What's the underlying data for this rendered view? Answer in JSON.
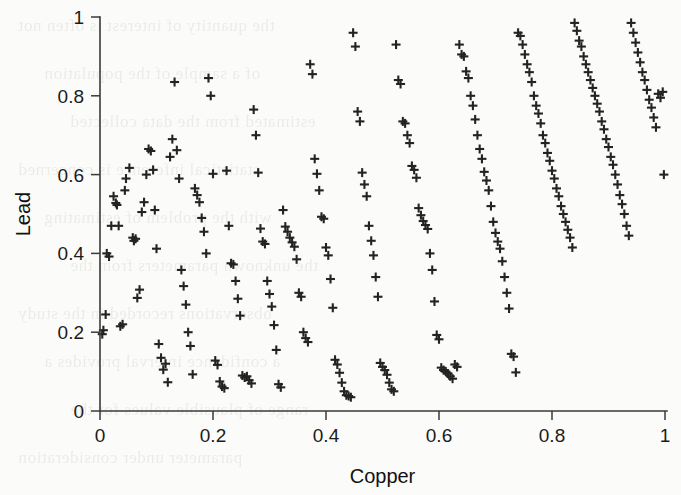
{
  "figure": {
    "width": 681,
    "height": 495,
    "background_color": "#fbfbf9",
    "marker_color": "#232323",
    "axis_color": "#3a3a3a"
  },
  "bleed_through_text": [
    "the quantity of interest is often not",
    "of a sample of the population",
    "estimated from the data collected",
    "statistical inference is concerned",
    "with the problem of estimating",
    "the unknown parameters from the",
    "observations recorded in the study",
    "a confidence interval provides a",
    "range of plausible values for the",
    "parameter under consideration"
  ],
  "chart_data": {
    "type": "scatter",
    "title": "",
    "xlabel": "Copper",
    "ylabel": "Lead",
    "xlim": [
      0,
      1
    ],
    "ylim": [
      0,
      1
    ],
    "grid": false,
    "legend": null,
    "marker": "plus",
    "marker_size": 9,
    "xticks": [
      0,
      0.2,
      0.4,
      0.6,
      0.8,
      1
    ],
    "xticklabels": [
      "0",
      "0.2",
      "0.4",
      "0.6",
      "0.8",
      "1"
    ],
    "yticks": [
      0,
      0.2,
      0.4,
      0.6,
      0.8,
      1
    ],
    "yticklabels": [
      "0",
      "0.2",
      "0.4",
      "0.6",
      "0.8",
      "1"
    ],
    "n_points": 249,
    "points": [
      [
        0.004,
        0.195
      ],
      [
        0.006,
        0.205
      ],
      [
        0.01,
        0.245
      ],
      [
        0.012,
        0.4
      ],
      [
        0.016,
        0.392
      ],
      [
        0.02,
        0.47
      ],
      [
        0.024,
        0.545
      ],
      [
        0.028,
        0.528
      ],
      [
        0.03,
        0.523
      ],
      [
        0.033,
        0.47
      ],
      [
        0.036,
        0.215
      ],
      [
        0.04,
        0.22
      ],
      [
        0.044,
        0.56
      ],
      [
        0.046,
        0.59
      ],
      [
        0.052,
        0.617
      ],
      [
        0.058,
        0.44
      ],
      [
        0.06,
        0.432
      ],
      [
        0.063,
        0.437
      ],
      [
        0.066,
        0.287
      ],
      [
        0.07,
        0.308
      ],
      [
        0.074,
        0.505
      ],
      [
        0.078,
        0.53
      ],
      [
        0.082,
        0.6
      ],
      [
        0.086,
        0.665
      ],
      [
        0.09,
        0.66
      ],
      [
        0.094,
        0.612
      ],
      [
        0.097,
        0.51
      ],
      [
        0.1,
        0.412
      ],
      [
        0.104,
        0.17
      ],
      [
        0.108,
        0.135
      ],
      [
        0.112,
        0.105
      ],
      [
        0.116,
        0.12
      ],
      [
        0.12,
        0.073
      ],
      [
        0.124,
        0.645
      ],
      [
        0.128,
        0.69
      ],
      [
        0.132,
        0.835
      ],
      [
        0.136,
        0.662
      ],
      [
        0.14,
        0.59
      ],
      [
        0.144,
        0.358
      ],
      [
        0.148,
        0.317
      ],
      [
        0.152,
        0.27
      ],
      [
        0.156,
        0.2
      ],
      [
        0.16,
        0.165
      ],
      [
        0.164,
        0.093
      ],
      [
        0.168,
        0.565
      ],
      [
        0.172,
        0.548
      ],
      [
        0.176,
        0.53
      ],
      [
        0.18,
        0.49
      ],
      [
        0.184,
        0.455
      ],
      [
        0.188,
        0.4
      ],
      [
        0.192,
        0.845
      ],
      [
        0.196,
        0.8
      ],
      [
        0.2,
        0.602
      ],
      [
        0.204,
        0.128
      ],
      [
        0.208,
        0.117
      ],
      [
        0.212,
        0.075
      ],
      [
        0.216,
        0.062
      ],
      [
        0.22,
        0.058
      ],
      [
        0.224,
        0.61
      ],
      [
        0.228,
        0.47
      ],
      [
        0.232,
        0.375
      ],
      [
        0.236,
        0.372
      ],
      [
        0.24,
        0.33
      ],
      [
        0.244,
        0.285
      ],
      [
        0.248,
        0.242
      ],
      [
        0.252,
        0.09
      ],
      [
        0.256,
        0.085
      ],
      [
        0.26,
        0.088
      ],
      [
        0.264,
        0.078
      ],
      [
        0.268,
        0.07
      ],
      [
        0.272,
        0.765
      ],
      [
        0.276,
        0.7
      ],
      [
        0.28,
        0.605
      ],
      [
        0.284,
        0.463
      ],
      [
        0.288,
        0.43
      ],
      [
        0.292,
        0.424
      ],
      [
        0.296,
        0.33
      ],
      [
        0.3,
        0.297
      ],
      [
        0.304,
        0.265
      ],
      [
        0.308,
        0.218
      ],
      [
        0.312,
        0.155
      ],
      [
        0.316,
        0.068
      ],
      [
        0.32,
        0.06
      ],
      [
        0.324,
        0.51
      ],
      [
        0.328,
        0.468
      ],
      [
        0.332,
        0.455
      ],
      [
        0.336,
        0.44
      ],
      [
        0.34,
        0.428
      ],
      [
        0.344,
        0.417
      ],
      [
        0.348,
        0.385
      ],
      [
        0.352,
        0.3
      ],
      [
        0.356,
        0.29
      ],
      [
        0.36,
        0.2
      ],
      [
        0.364,
        0.185
      ],
      [
        0.368,
        0.175
      ],
      [
        0.372,
        0.88
      ],
      [
        0.376,
        0.855
      ],
      [
        0.38,
        0.64
      ],
      [
        0.384,
        0.602
      ],
      [
        0.388,
        0.56
      ],
      [
        0.392,
        0.493
      ],
      [
        0.396,
        0.488
      ],
      [
        0.4,
        0.415
      ],
      [
        0.404,
        0.395
      ],
      [
        0.408,
        0.335
      ],
      [
        0.412,
        0.262
      ],
      [
        0.416,
        0.13
      ],
      [
        0.42,
        0.118
      ],
      [
        0.424,
        0.097
      ],
      [
        0.428,
        0.072
      ],
      [
        0.432,
        0.05
      ],
      [
        0.436,
        0.04
      ],
      [
        0.44,
        0.038
      ],
      [
        0.444,
        0.035
      ],
      [
        0.448,
        0.96
      ],
      [
        0.452,
        0.925
      ],
      [
        0.456,
        0.76
      ],
      [
        0.46,
        0.735
      ],
      [
        0.464,
        0.605
      ],
      [
        0.468,
        0.575
      ],
      [
        0.472,
        0.545
      ],
      [
        0.476,
        0.47
      ],
      [
        0.48,
        0.432
      ],
      [
        0.484,
        0.395
      ],
      [
        0.488,
        0.34
      ],
      [
        0.492,
        0.29
      ],
      [
        0.496,
        0.122
      ],
      [
        0.5,
        0.112
      ],
      [
        0.504,
        0.104
      ],
      [
        0.508,
        0.092
      ],
      [
        0.512,
        0.072
      ],
      [
        0.516,
        0.055
      ],
      [
        0.52,
        0.05
      ],
      [
        0.524,
        0.93
      ],
      [
        0.528,
        0.84
      ],
      [
        0.532,
        0.83
      ],
      [
        0.536,
        0.735
      ],
      [
        0.54,
        0.73
      ],
      [
        0.544,
        0.7
      ],
      [
        0.548,
        0.68
      ],
      [
        0.552,
        0.622
      ],
      [
        0.556,
        0.612
      ],
      [
        0.56,
        0.592
      ],
      [
        0.564,
        0.515
      ],
      [
        0.568,
        0.497
      ],
      [
        0.572,
        0.482
      ],
      [
        0.576,
        0.472
      ],
      [
        0.58,
        0.462
      ],
      [
        0.584,
        0.4
      ],
      [
        0.588,
        0.358
      ],
      [
        0.592,
        0.278
      ],
      [
        0.596,
        0.193
      ],
      [
        0.6,
        0.182
      ],
      [
        0.604,
        0.11
      ],
      [
        0.608,
        0.104
      ],
      [
        0.612,
        0.1
      ],
      [
        0.616,
        0.095
      ],
      [
        0.62,
        0.088
      ],
      [
        0.624,
        0.082
      ],
      [
        0.628,
        0.118
      ],
      [
        0.632,
        0.112
      ],
      [
        0.636,
        0.93
      ],
      [
        0.64,
        0.905
      ],
      [
        0.644,
        0.9
      ],
      [
        0.648,
        0.862
      ],
      [
        0.652,
        0.845
      ],
      [
        0.656,
        0.8
      ],
      [
        0.66,
        0.775
      ],
      [
        0.664,
        0.74
      ],
      [
        0.668,
        0.7
      ],
      [
        0.672,
        0.665
      ],
      [
        0.676,
        0.64
      ],
      [
        0.68,
        0.607
      ],
      [
        0.684,
        0.585
      ],
      [
        0.688,
        0.56
      ],
      [
        0.692,
        0.52
      ],
      [
        0.696,
        0.48
      ],
      [
        0.7,
        0.452
      ],
      [
        0.704,
        0.43
      ],
      [
        0.708,
        0.412
      ],
      [
        0.712,
        0.38
      ],
      [
        0.716,
        0.34
      ],
      [
        0.72,
        0.3
      ],
      [
        0.724,
        0.26
      ],
      [
        0.728,
        0.145
      ],
      [
        0.732,
        0.138
      ],
      [
        0.736,
        0.098
      ],
      [
        0.74,
        0.96
      ],
      [
        0.744,
        0.952
      ],
      [
        0.748,
        0.93
      ],
      [
        0.752,
        0.905
      ],
      [
        0.756,
        0.88
      ],
      [
        0.76,
        0.86
      ],
      [
        0.764,
        0.835
      ],
      [
        0.768,
        0.8
      ],
      [
        0.772,
        0.775
      ],
      [
        0.776,
        0.755
      ],
      [
        0.78,
        0.73
      ],
      [
        0.784,
        0.7
      ],
      [
        0.788,
        0.68
      ],
      [
        0.792,
        0.655
      ],
      [
        0.796,
        0.635
      ],
      [
        0.8,
        0.61
      ],
      [
        0.804,
        0.59
      ],
      [
        0.808,
        0.565
      ],
      [
        0.812,
        0.545
      ],
      [
        0.816,
        0.52
      ],
      [
        0.82,
        0.5
      ],
      [
        0.824,
        0.48
      ],
      [
        0.828,
        0.46
      ],
      [
        0.832,
        0.44
      ],
      [
        0.836,
        0.415
      ],
      [
        0.84,
        0.985
      ],
      [
        0.844,
        0.965
      ],
      [
        0.848,
        0.94
      ],
      [
        0.852,
        0.925
      ],
      [
        0.856,
        0.9
      ],
      [
        0.86,
        0.88
      ],
      [
        0.864,
        0.86
      ],
      [
        0.868,
        0.84
      ],
      [
        0.872,
        0.82
      ],
      [
        0.876,
        0.8
      ],
      [
        0.88,
        0.78
      ],
      [
        0.884,
        0.76
      ],
      [
        0.888,
        0.735
      ],
      [
        0.892,
        0.715
      ],
      [
        0.896,
        0.69
      ],
      [
        0.9,
        0.67
      ],
      [
        0.904,
        0.645
      ],
      [
        0.908,
        0.625
      ],
      [
        0.912,
        0.6
      ],
      [
        0.916,
        0.575
      ],
      [
        0.92,
        0.548
      ],
      [
        0.924,
        0.525
      ],
      [
        0.928,
        0.5
      ],
      [
        0.932,
        0.47
      ],
      [
        0.936,
        0.445
      ],
      [
        0.94,
        0.985
      ],
      [
        0.944,
        0.96
      ],
      [
        0.948,
        0.935
      ],
      [
        0.952,
        0.91
      ],
      [
        0.956,
        0.885
      ],
      [
        0.96,
        0.86
      ],
      [
        0.964,
        0.84
      ],
      [
        0.968,
        0.815
      ],
      [
        0.972,
        0.79
      ],
      [
        0.976,
        0.77
      ],
      [
        0.98,
        0.745
      ],
      [
        0.984,
        0.72
      ],
      [
        0.988,
        0.805
      ],
      [
        0.992,
        0.795
      ],
      [
        0.996,
        0.81
      ],
      [
        0.998,
        0.6
      ]
    ]
  }
}
